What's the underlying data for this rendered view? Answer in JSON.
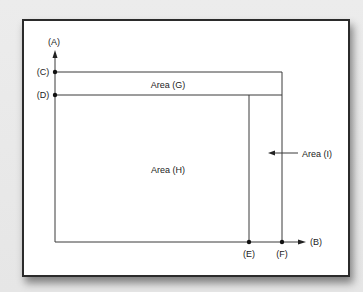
{
  "diagram": {
    "axes": {
      "y_axis_label": "(A)",
      "x_axis_label": "(B)"
    },
    "y_points": [
      {
        "label": "(C)"
      },
      {
        "label": "(D)"
      }
    ],
    "x_points": [
      {
        "label": "(E)"
      },
      {
        "label": "(F)"
      }
    ],
    "areas": {
      "g": "Area (G)",
      "h": "Area (H)",
      "i": "Area (I)"
    },
    "colors": {
      "line": "#3a3a3a",
      "frame_border": "#2b2b2b",
      "background": "#e9e9e9",
      "panel": "#ffffff"
    }
  }
}
